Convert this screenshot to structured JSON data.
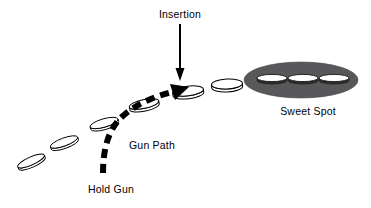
{
  "diagram": {
    "background_color": "#ffffff",
    "outline_color": "#000000",
    "sweet_spot_fill": "#58585a",
    "path_color": "#000000",
    "labels": {
      "insertion": "Insertion",
      "gun_path": "Gun Path",
      "hold_gun": "Hold Gun",
      "sweet_spot": "Sweet Spot"
    },
    "label_positions": {
      "insertion": {
        "x": 180,
        "y": 17,
        "anchor": "middle"
      },
      "gun_path": {
        "x": 129,
        "y": 148,
        "anchor": "start"
      },
      "hold_gun": {
        "x": 111,
        "y": 192,
        "anchor": "middle"
      },
      "sweet_spot": {
        "x": 308,
        "y": 114,
        "anchor": "middle"
      }
    },
    "insertion_arrow": {
      "x": 180,
      "y_start": 24,
      "y_end": 80,
      "stroke_width": 2,
      "head_width": 9,
      "head_length": 11
    },
    "gun_path_arrow": {
      "dash_pattern": "9 6",
      "stroke_width": 6,
      "path": "M 103,173 C 103,150 108,128 124,115 C 140,101 160,95 178,91",
      "head_tip": {
        "x": 189,
        "y": 88
      },
      "head_size": 13
    },
    "discs": [
      {
        "name": "disc-1",
        "cx": 31,
        "cy": 161,
        "rx": 14.5,
        "ry": 4.0,
        "rotation": -24,
        "thickness": 2.5
      },
      {
        "name": "disc-2",
        "cx": 64,
        "cy": 142,
        "rx": 14.5,
        "ry": 4.0,
        "rotation": -20,
        "thickness": 2.5
      },
      {
        "name": "disc-3",
        "cx": 104,
        "cy": 123,
        "rx": 14.5,
        "ry": 4.2,
        "rotation": -16,
        "thickness": 2.5
      },
      {
        "name": "disc-4",
        "cx": 144,
        "cy": 104,
        "rx": 15.0,
        "ry": 4.4,
        "rotation": -12,
        "thickness": 2.8
      },
      {
        "name": "disc-5",
        "cx": 188,
        "cy": 91,
        "rx": 15.5,
        "ry": 4.8,
        "rotation": -7,
        "thickness": 3.0
      },
      {
        "name": "disc-6",
        "cx": 227,
        "cy": 84,
        "rx": 15.5,
        "ry": 5.0,
        "rotation": -3,
        "thickness": 3.0
      }
    ],
    "sweet_spot": {
      "cx": 301,
      "cy": 80,
      "rx": 57,
      "ry": 18,
      "inner_discs": [
        {
          "name": "sweet-spot-disc-left",
          "cx": 272,
          "cy": 78,
          "rx": 15,
          "ry": 3.6,
          "thickness": 2.4
        },
        {
          "name": "sweet-spot-disc-center",
          "cx": 303,
          "cy": 78,
          "rx": 15,
          "ry": 3.6,
          "thickness": 2.4
        },
        {
          "name": "sweet-spot-disc-right",
          "cx": 334,
          "cy": 78,
          "rx": 15,
          "ry": 3.6,
          "thickness": 2.4
        }
      ]
    }
  }
}
